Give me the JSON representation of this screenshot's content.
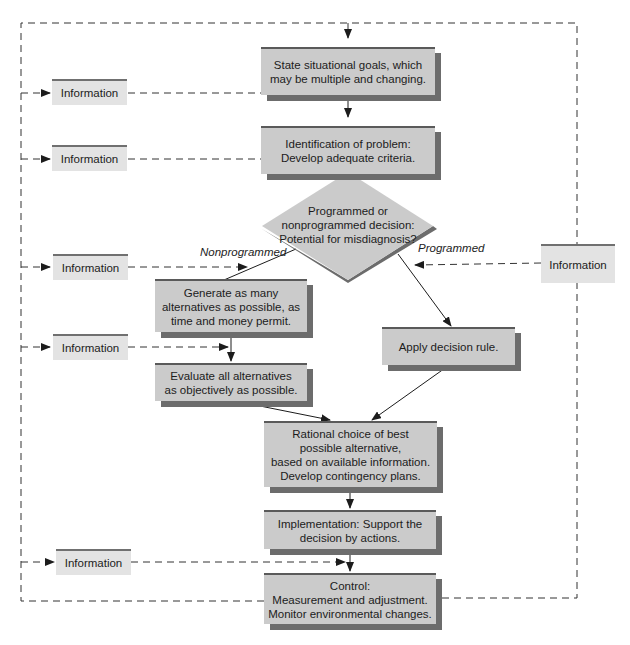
{
  "diagram": {
    "steps": [
      {
        "id": "goals",
        "text": "State situational goals, which\nmay be multiple and changing."
      },
      {
        "id": "problem",
        "text": "Identification of problem:\nDevelop adequate criteria."
      },
      {
        "id": "generate",
        "text": "Generate as many\nalternatives as possible, as\ntime and money permit."
      },
      {
        "id": "evaluate",
        "text": "Evaluate all alternatives\nas objectively as possible."
      },
      {
        "id": "apply",
        "text": "Apply decision rule."
      },
      {
        "id": "rational",
        "text": "Rational choice of best\npossible alternative,\nbased on available information.\nDevelop contingency plans."
      },
      {
        "id": "implementation",
        "text": "Implementation: Support the\ndecision by actions."
      },
      {
        "id": "control",
        "text": "Control:\nMeasurement and adjustment.\nMonitor environmental changes."
      }
    ],
    "decision": {
      "text": "Programmed or\nnonprogrammed decision:\nPotential for misdiagnosis?"
    },
    "branches": {
      "left": "Nonprogrammed",
      "right": "Programmed"
    },
    "information_label": "Information",
    "info_boxes": [
      "Information",
      "Information",
      "Information",
      "Information",
      "Information",
      "Information"
    ],
    "colors": {
      "box_fill": "#cbcbcb",
      "box_shadow": "#6c6c6c",
      "info_fill": "#e3e3e3",
      "line": "#1c1c1c"
    }
  }
}
